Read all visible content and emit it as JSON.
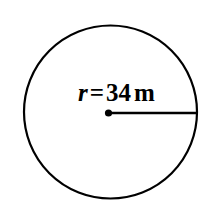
{
  "figure": {
    "type": "circle-with-radius",
    "background_color": "#ffffff",
    "stroke_color": "#000000",
    "canvas": {
      "width": 218,
      "height": 215
    },
    "circle": {
      "center_x": 110.5,
      "center_y": 112,
      "radius_px": 86.5,
      "stroke_width": 2.2
    },
    "center_dot": {
      "x": 108.5,
      "y": 113,
      "radius_px": 3.6
    },
    "radius_segment": {
      "x1": 108.5,
      "y1": 113,
      "x2": 197,
      "y2": 113,
      "stroke_width": 2.6
    },
    "label": {
      "full_text": "r = 34 m",
      "variable": "r",
      "equals": "=",
      "value": "34",
      "unit": "m",
      "font_size_px": 25,
      "color": "#000000"
    }
  }
}
